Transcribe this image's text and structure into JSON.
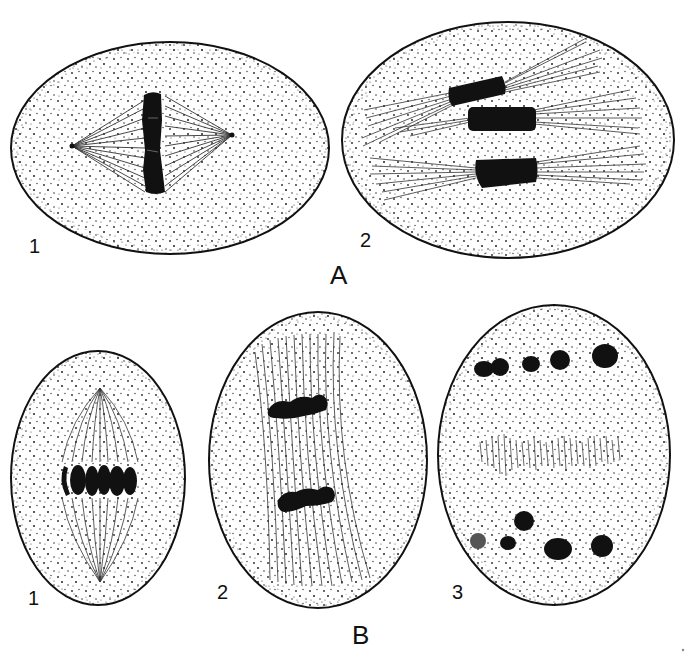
{
  "figure": {
    "type": "scientific-illustration",
    "colors": {
      "ink": "#111111",
      "background": "#ffffff"
    }
  },
  "groups": [
    {
      "id": "A",
      "label": "A",
      "cells": [
        {
          "id": "A1",
          "label": "1",
          "description": "oval cell, spindle between two poles, single dark vertical chromosome band at equator"
        },
        {
          "id": "A2",
          "label": "2",
          "description": "oval cell, three dark chromosome blocks each with fibers radiating both ways"
        }
      ]
    },
    {
      "id": "B",
      "label": "B",
      "cells": [
        {
          "id": "B1",
          "label": "1",
          "description": "upright oval cell, fusiform spindle, row of dark chromosomes at equator"
        },
        {
          "id": "B2",
          "label": "2",
          "description": "upright oval cell, parallel fibers, two bands of chromosomes separating"
        },
        {
          "id": "B3",
          "label": "3",
          "description": "upright oval cell, two groups of clumped chromosomes at poles, short fibers in middle"
        }
      ]
    }
  ],
  "corner_mark": "."
}
